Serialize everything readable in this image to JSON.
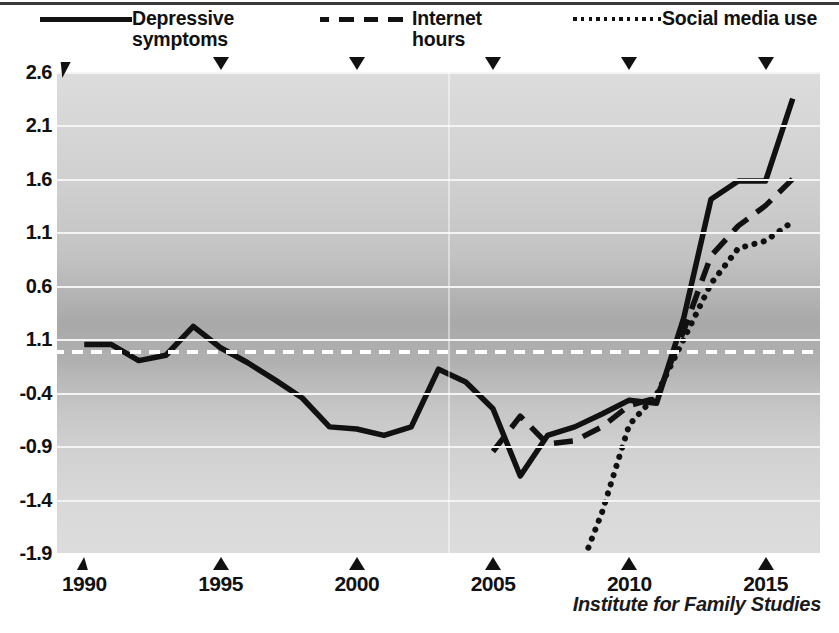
{
  "legend": {
    "items": [
      {
        "label": "Depressive\nsymptoms",
        "style": "solid",
        "icon": "solid-line-swatch",
        "x": 40
      },
      {
        "label": "Internet\nhours",
        "style": "dashed",
        "icon": "dashed-line-swatch",
        "x": 320
      },
      {
        "label": "Social media use",
        "style": "dotted",
        "icon": "dotted-line-swatch",
        "x": 570
      }
    ]
  },
  "attribution": "Institute for Family Studies",
  "chart_data": {
    "type": "line",
    "title": "",
    "xlabel": "",
    "ylabel": "",
    "xlim": [
      1989,
      2017
    ],
    "ylim": [
      -1.9,
      2.6
    ],
    "grid": true,
    "legend_position": "top",
    "y_ticks": [
      2.6,
      2.1,
      1.6,
      1.1,
      0.6,
      1.1,
      -0.4,
      -0.9,
      -1.4,
      -1.9
    ],
    "y_tick_labels": [
      "2.6",
      "2.1",
      "1.6",
      "1.1",
      "0.6",
      "1.1",
      "-0.4",
      "-0.9",
      "-1.4",
      "-1.9"
    ],
    "y_tick_values": [
      2.6,
      2.1,
      1.6,
      1.1,
      0.6,
      0.1,
      -0.4,
      -0.9,
      -1.4,
      -1.9
    ],
    "x_ticks": [
      1990,
      1995,
      2000,
      2005,
      2010,
      2015
    ],
    "x_tick_labels": [
      "1990",
      "1995",
      "2000",
      "2005",
      "2010",
      "2015"
    ],
    "reference_line": {
      "value": 0.0,
      "style": "dashed",
      "color": "#ffffff"
    },
    "series": [
      {
        "name": "Depressive symptoms",
        "style": "solid",
        "color": "#111111",
        "x": [
          1990,
          1991,
          1992,
          1993,
          1994,
          1995,
          1996,
          1997,
          1998,
          1999,
          2000,
          2001,
          2002,
          2003,
          2004,
          2005,
          2006,
          2007,
          2008,
          2009,
          2010,
          2011,
          2012,
          2013,
          2014,
          2015,
          2016
        ],
        "y": [
          0.05,
          0.05,
          -0.1,
          -0.05,
          0.22,
          0.02,
          -0.12,
          -0.28,
          -0.45,
          -0.72,
          -0.74,
          -0.8,
          -0.72,
          -0.18,
          -0.3,
          -0.55,
          -1.18,
          -0.8,
          -0.72,
          -0.6,
          -0.47,
          -0.5,
          0.3,
          1.41,
          1.58,
          1.58,
          2.35
        ]
      },
      {
        "name": "Internet hours",
        "style": "dashed",
        "color": "#111111",
        "x": [
          2005,
          2006,
          2007,
          2008,
          2009,
          2010,
          2011,
          2012,
          2013,
          2014,
          2015,
          2016
        ],
        "y": [
          -0.95,
          -0.62,
          -0.88,
          -0.85,
          -0.72,
          -0.52,
          -0.45,
          0.18,
          0.88,
          1.16,
          1.35,
          1.6
        ]
      },
      {
        "name": "Social media use",
        "style": "dotted",
        "color": "#111111",
        "x": [
          2008.5,
          2009,
          2010,
          2011,
          2012,
          2013,
          2014,
          2015,
          2016
        ],
        "y": [
          -1.85,
          -1.52,
          -0.7,
          -0.42,
          0.1,
          0.62,
          0.95,
          1.02,
          1.2
        ]
      }
    ]
  }
}
